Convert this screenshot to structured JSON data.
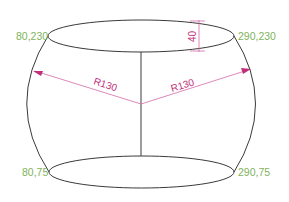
{
  "diagram": {
    "type": "barrel-shape-cad-drawing",
    "colors": {
      "outline": "#3a3a3a",
      "coordinate_label": "#7fb35a",
      "dimension": "#c0307a",
      "dimension_line": "#d46aa6"
    },
    "labels": {
      "top_left": "80,230",
      "top_right": "290,230",
      "bottom_left": "80,75",
      "bottom_right": "290,75",
      "radius_left": "R130",
      "radius_right": "R130",
      "height_dim": "40"
    }
  }
}
